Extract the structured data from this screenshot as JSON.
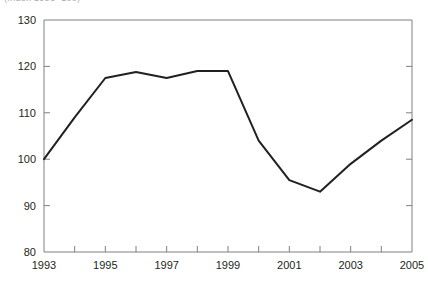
{
  "chart_data": {
    "type": "line",
    "title": "",
    "subtitle": "(Index 1993=100)",
    "xlabel": "",
    "ylabel": "",
    "x": [
      1993,
      1994,
      1995,
      1996,
      1997,
      1998,
      1999,
      2000,
      2001,
      2002,
      2003,
      2004,
      2005
    ],
    "values": [
      100,
      109,
      117.5,
      118.8,
      117.5,
      119,
      119,
      104,
      95.5,
      93,
      99,
      104,
      108.5
    ],
    "series": [
      {
        "name": "Index",
        "values": [
          100,
          109,
          117.5,
          118.8,
          117.5,
          119,
          119,
          104,
          95.5,
          93,
          99,
          104,
          108.5
        ]
      }
    ],
    "xlim": [
      1993,
      2005
    ],
    "ylim": [
      80,
      130
    ],
    "y_ticks": [
      80,
      90,
      100,
      110,
      120,
      130
    ],
    "y_tick_labels": [
      "80",
      "90",
      "100",
      "110",
      "120",
      "130"
    ],
    "x_ticks": [
      1993,
      1994,
      1995,
      1996,
      1997,
      1998,
      1999,
      2000,
      2001,
      2002,
      2003,
      2004,
      2005
    ],
    "x_tick_labels": [
      "1993",
      "",
      "1995",
      "",
      "1997",
      "",
      "1999",
      "",
      "2001",
      "",
      "2003",
      "",
      "2005"
    ],
    "x_labeled_ticks": [
      "1993",
      "1995",
      "1997",
      "1999",
      "2001",
      "2003",
      "2005"
    ],
    "grid": false,
    "legend": "none",
    "line_color": "#231f20",
    "axis_color": "#808080",
    "background_color": "#ffffff"
  }
}
